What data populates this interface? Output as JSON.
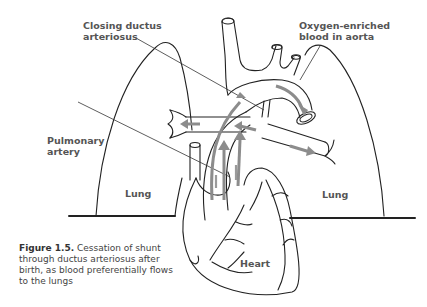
{
  "figure": {
    "labels": {
      "ductus": [
        "Closing ductus",
        "arteriosus"
      ],
      "aorta": [
        "Oxygen-enriched",
        "blood in aorta"
      ],
      "pulmonary": [
        "Pulmonary",
        "artery"
      ],
      "lung_left": "Lung",
      "lung_right": "Lung",
      "heart": "Heart"
    },
    "caption": {
      "number": "Figure 1.5.",
      "text": "Cessation of shunt through ductus arteriosus after birth, as blood preferentially flows to the lungs"
    },
    "colors": {
      "outline": "#222222",
      "arrow": "#8c8c8c",
      "label": "#555555"
    }
  }
}
